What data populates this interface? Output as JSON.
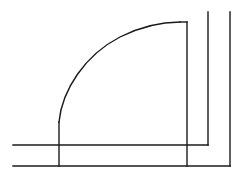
{
  "diagram": {
    "type": "floor-plan-door-symbol",
    "width": 240,
    "height": 174,
    "stroke_color": "#1a1a1a",
    "background": "#ffffff",
    "elements": {
      "wall_inner_horizontal": {
        "x1": 13,
        "y1": 145,
        "x2": 208,
        "y2": 145
      },
      "wall_inner_vertical": {
        "x1": 208,
        "y1": 12,
        "x2": 208,
        "y2": 145
      },
      "wall_outer_horizontal": {
        "x1": 13,
        "y1": 166,
        "x2": 230,
        "y2": 166
      },
      "wall_outer_vertical": {
        "x1": 230,
        "y1": 12,
        "x2": 230,
        "y2": 166
      },
      "door_jamb_left": {
        "x1": 59,
        "y1": 122,
        "x2": 59,
        "y2": 166
      },
      "door_leaf": {
        "x1": 187,
        "y1": 22,
        "x2": 187,
        "y2": 166
      },
      "swing_arc": {
        "start_x": 59,
        "start_y": 122,
        "end_x": 187,
        "end_y": 22
      }
    }
  }
}
